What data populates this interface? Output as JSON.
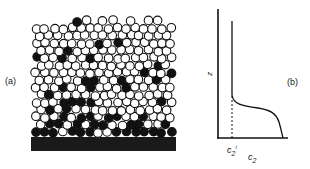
{
  "figure": {
    "panel_a": {
      "label": "(a)",
      "description": "Packing of particles: open circles (species 1) and filled circles (species 2) accumulating near the substrate",
      "colors": {
        "filled": "#111111",
        "open_fill": "#ffffff",
        "stroke": "#111111",
        "substrate": "#1a1a1a"
      }
    },
    "panel_b": {
      "label": "(b)",
      "y_axis_label": "z",
      "x_axis_label_base": "c",
      "x_axis_label_sub": "2",
      "tick_label_base": "c",
      "tick_label_sub": "2",
      "tick_label_sup": "i"
    }
  }
}
